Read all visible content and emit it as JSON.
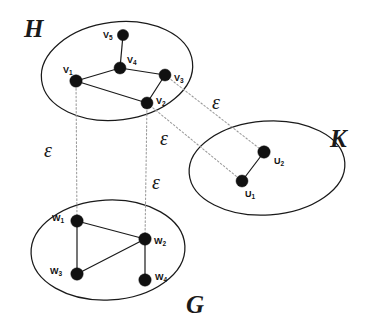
{
  "diagram": {
    "type": "graph-homomorphism",
    "background": "#ffffff",
    "ink_color": "#111111",
    "map_line_color": "#9a9a9a",
    "sets": [
      {
        "id": "H",
        "label": "H",
        "label_x": 24,
        "label_y": 16,
        "cx": 117,
        "cy": 71,
        "rx": 76,
        "ry": 49,
        "rotate": -7
      },
      {
        "id": "K",
        "label": "K",
        "label_x": 330,
        "label_y": 126,
        "cx": 267,
        "cy": 168,
        "rx": 78,
        "ry": 47,
        "rotate": -4
      },
      {
        "id": "G",
        "label": "G",
        "label_x": 186,
        "label_y": 292,
        "cx": 108,
        "cy": 250,
        "rx": 77,
        "ry": 50,
        "rotate": -3
      }
    ],
    "vertices": [
      {
        "id": "v5",
        "set": "H",
        "label": "V",
        "sub": "5",
        "x": 123,
        "y": 35,
        "r": 5.6,
        "label_x": 103,
        "label_y": 31
      },
      {
        "id": "v4",
        "set": "H",
        "label": "V",
        "sub": "4",
        "x": 120,
        "y": 68,
        "r": 6.0,
        "label_x": 127,
        "label_y": 56
      },
      {
        "id": "v1",
        "set": "H",
        "label": "V",
        "sub": "1",
        "x": 76,
        "y": 81,
        "r": 6.2,
        "label_x": 63,
        "label_y": 66
      },
      {
        "id": "v3",
        "set": "H",
        "label": "V",
        "sub": "3",
        "x": 165,
        "y": 75,
        "r": 6.0,
        "label_x": 174,
        "label_y": 74
      },
      {
        "id": "v2",
        "set": "H",
        "label": "V",
        "sub": "2",
        "x": 147,
        "y": 103,
        "r": 6.0,
        "label_x": 156,
        "label_y": 97
      },
      {
        "id": "u2",
        "set": "K",
        "label": "U",
        "sub": "2",
        "x": 264,
        "y": 152,
        "r": 6.2,
        "label_x": 274,
        "label_y": 157
      },
      {
        "id": "u1",
        "set": "K",
        "label": "U",
        "sub": "1",
        "x": 242,
        "y": 181,
        "r": 6.0,
        "label_x": 245,
        "label_y": 190
      },
      {
        "id": "w1",
        "set": "G",
        "label": "W",
        "sub": "1",
        "x": 77,
        "y": 221,
        "r": 6.2,
        "label_x": 52,
        "label_y": 214
      },
      {
        "id": "w2",
        "set": "G",
        "label": "W",
        "sub": "2",
        "x": 145,
        "y": 239,
        "r": 6.2,
        "label_x": 154,
        "label_y": 237
      },
      {
        "id": "w3",
        "set": "G",
        "label": "W",
        "sub": "3",
        "x": 77,
        "y": 274,
        "r": 6.2,
        "label_x": 50,
        "label_y": 267
      },
      {
        "id": "w4",
        "set": "G",
        "label": "W",
        "sub": "4",
        "x": 145,
        "y": 280,
        "r": 6.2,
        "label_x": 155,
        "label_y": 273
      }
    ],
    "edges": [
      {
        "from": "v5",
        "to": "v4"
      },
      {
        "from": "v4",
        "to": "v1"
      },
      {
        "from": "v4",
        "to": "v3"
      },
      {
        "from": "v3",
        "to": "v2"
      },
      {
        "from": "v1",
        "to": "v2"
      },
      {
        "from": "u2",
        "to": "u1"
      },
      {
        "from": "w1",
        "to": "w2"
      },
      {
        "from": "w1",
        "to": "w3"
      },
      {
        "from": "w3",
        "to": "w2"
      },
      {
        "from": "w2",
        "to": "w4"
      }
    ],
    "mappings": [
      {
        "id": "map-v1-w1",
        "from": "v1",
        "to": "w1",
        "label": "ε",
        "label_x": 44,
        "label_y": 140
      },
      {
        "id": "map-v2-w2",
        "from": "v2",
        "to": "w2",
        "label": "ε",
        "label_x": 152,
        "label_y": 172
      },
      {
        "id": "map-v3-u2",
        "from": "v3",
        "to": "u2",
        "label": "ε",
        "label_x": 212,
        "label_y": 92
      },
      {
        "id": "map-v2-u1",
        "from": "v2",
        "to": "u1",
        "label": "ε",
        "label_x": 160,
        "label_y": 128
      }
    ]
  }
}
